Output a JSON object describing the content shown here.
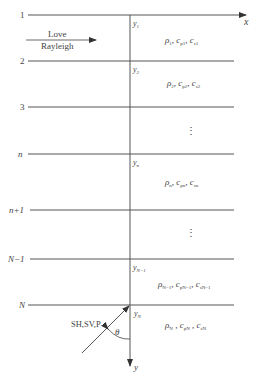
{
  "diagram": {
    "type": "layered half-space model",
    "axes": {
      "x_label": "x",
      "y_label": "y"
    },
    "wave_direction": {
      "line1": "Love",
      "line2": "Rayleigh"
    },
    "incident_wave": {
      "label": "SH,SV,P",
      "angle": "θ"
    },
    "interfaces": [
      {
        "label": "1",
        "depth_label_base": "y",
        "depth_label_sub": "1"
      },
      {
        "label": "2",
        "depth_label_base": "y",
        "depth_label_sub": "2"
      },
      {
        "label": "3"
      },
      {
        "label": "n",
        "depth_label_base": "y",
        "depth_label_sub": "n"
      },
      {
        "label": "n+1"
      },
      {
        "label": "N−1",
        "depth_label_base": "y",
        "depth_label_sub": "N−1"
      },
      {
        "label": "N",
        "depth_label_base": "y",
        "depth_label_sub": "N"
      }
    ],
    "layers": [
      {
        "rho": "ρ",
        "rho_sub": "1",
        "cp": "c",
        "cp_sub": "p1",
        "cs": "c",
        "cs_sub": "s1"
      },
      {
        "rho": "ρ",
        "rho_sub": "2",
        "cp": "c",
        "cp_sub": "p2",
        "cs": "c",
        "cs_sub": "s2"
      },
      {
        "ellipsis": "⋮"
      },
      {
        "rho": "ρ",
        "rho_sub": "n",
        "cp": "c",
        "cp_sub": "pn",
        "cs": "c",
        "cs_sub": "sn"
      },
      {
        "ellipsis": "⋮"
      },
      {
        "rho": "ρ",
        "rho_sub": "N−1",
        "cp": "c",
        "cp_sub": "pN−1",
        "cs": "c",
        "cs_sub": "sN−1"
      },
      {
        "rho": "ρ",
        "rho_sub": "N",
        "cp": "c",
        "cp_sub": "pN",
        "cs": "c",
        "cs_sub": "sN"
      }
    ]
  }
}
